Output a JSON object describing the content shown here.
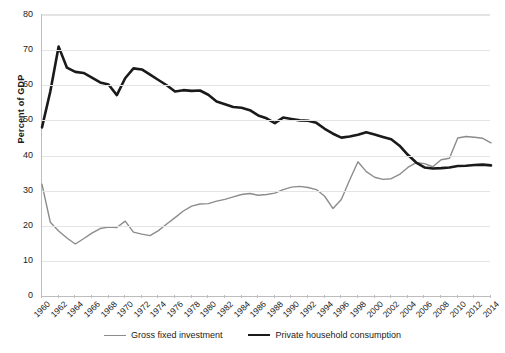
{
  "chart_data": {
    "type": "line",
    "title": "",
    "xlabel": "",
    "ylabel": "Percent of GDP",
    "ylim": [
      0,
      80
    ],
    "ytick_step": 10,
    "yticks": [
      0,
      10,
      20,
      30,
      40,
      50,
      60,
      70,
      80
    ],
    "xlim": [
      1960,
      2014
    ],
    "grid": true,
    "legend_position": "bottom",
    "x": [
      1960,
      1961,
      1962,
      1963,
      1964,
      1965,
      1966,
      1967,
      1968,
      1969,
      1970,
      1971,
      1972,
      1973,
      1974,
      1975,
      1976,
      1977,
      1978,
      1979,
      1980,
      1981,
      1982,
      1983,
      1984,
      1985,
      1986,
      1987,
      1988,
      1989,
      1990,
      1991,
      1992,
      1993,
      1994,
      1995,
      1996,
      1997,
      1998,
      1999,
      2000,
      2001,
      2002,
      2003,
      2004,
      2005,
      2006,
      2007,
      2008,
      2009,
      2010,
      2011,
      2012,
      2013,
      2014
    ],
    "xticks": [
      "1960",
      "1962",
      "1964",
      "1966",
      "1968",
      "1970",
      "1972",
      "1974",
      "1976",
      "1978",
      "1980",
      "1982",
      "1984",
      "1986",
      "1988",
      "1990",
      "1992",
      "1994",
      "1996",
      "1998",
      "2000",
      "2002",
      "2004",
      "2006",
      "2008",
      "2010",
      "2012",
      "2014"
    ],
    "series": [
      {
        "name": "Gross fixed investment",
        "color": "#8c8c8c",
        "width": 1.4,
        "values": [
          31.8,
          21.0,
          18.5,
          16.5,
          14.8,
          16.3,
          17.9,
          19.2,
          19.6,
          19.5,
          21.3,
          18.2,
          17.6,
          17.2,
          18.6,
          20.5,
          22.3,
          24.2,
          25.6,
          26.2,
          26.3,
          27.0,
          27.5,
          28.2,
          28.9,
          29.2,
          28.7,
          28.9,
          29.3,
          30.3,
          31.0,
          31.2,
          30.9,
          30.3,
          28.4,
          24.9,
          27.5,
          33.0,
          38.2,
          35.4,
          33.8,
          33.2,
          33.4,
          34.6,
          36.6,
          38.0,
          37.7,
          36.8,
          38.8,
          39.2,
          45.0,
          45.4,
          45.2,
          44.9,
          43.6
        ]
      },
      {
        "name": "Private household consumption",
        "color": "#1a1a1a",
        "width": 2.6,
        "values": [
          48.0,
          58.2,
          71.0,
          65.0,
          63.8,
          63.5,
          62.2,
          60.8,
          60.2,
          57.2,
          62.0,
          64.8,
          64.5,
          63.0,
          61.5,
          60.0,
          58.2,
          58.6,
          58.4,
          58.5,
          57.3,
          55.4,
          54.6,
          53.8,
          53.6,
          52.9,
          51.4,
          50.6,
          49.2,
          50.8,
          50.4,
          50.0,
          49.9,
          49.3,
          47.6,
          46.2,
          45.1,
          45.4,
          45.9,
          46.6,
          46.0,
          45.3,
          44.6,
          42.8,
          40.2,
          38.0,
          36.6,
          36.3,
          36.4,
          36.6,
          37.0,
          37.1,
          37.3,
          37.4,
          37.2
        ]
      }
    ]
  },
  "legend": {
    "items": [
      {
        "label": "Gross fixed investment"
      },
      {
        "label": "Private household consumption"
      }
    ]
  },
  "axes": {
    "y_title": "Percent of GDP"
  }
}
